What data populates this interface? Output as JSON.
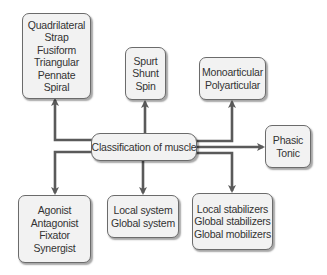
{
  "diagram": {
    "center": {
      "label": "Classification of muscle"
    },
    "nodes": {
      "shape": {
        "items": [
          "Quadrilateral",
          "Strap",
          "Fusiform",
          "Triangular",
          "Pennate",
          "Spiral"
        ]
      },
      "action_type": {
        "items": [
          "Spurt",
          "Shunt",
          "Spin"
        ]
      },
      "joints": {
        "items": [
          "Monoarticular",
          "Polyarticular"
        ]
      },
      "fiber_type": {
        "items": [
          "Phasic",
          "Tonic"
        ]
      },
      "role": {
        "items": [
          "Agonist",
          "Antagonist",
          "Fixator",
          "Synergist"
        ]
      },
      "system": {
        "items": [
          "Local system",
          "Global system"
        ]
      },
      "function": {
        "items": [
          "Local stabilizers",
          "Global stabilizers",
          "Global mobilizers"
        ]
      }
    },
    "colors": {
      "line": "#5a5a5a",
      "box_fill": "#f2f2f2",
      "box_border": "#6b6b6b",
      "text": "#333333"
    }
  }
}
